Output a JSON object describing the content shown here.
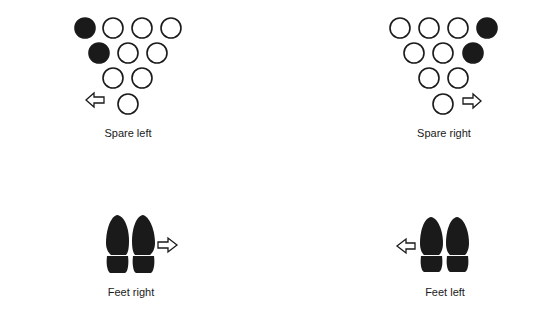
{
  "colors": {
    "ink": "#1a1a1a",
    "background": "#ffffff"
  },
  "panels": [
    {
      "id": "spare-left",
      "label": "Spare left",
      "type": "pins",
      "arrow": "left-arrow-icon",
      "pins": [
        {
          "row": 1,
          "pos": 1,
          "filled": true
        },
        {
          "row": 1,
          "pos": 2,
          "filled": false
        },
        {
          "row": 1,
          "pos": 3,
          "filled": false
        },
        {
          "row": 1,
          "pos": 4,
          "filled": false
        },
        {
          "row": 2,
          "pos": 1,
          "filled": true
        },
        {
          "row": 2,
          "pos": 2,
          "filled": false
        },
        {
          "row": 2,
          "pos": 3,
          "filled": false
        },
        {
          "row": 3,
          "pos": 1,
          "filled": false
        },
        {
          "row": 3,
          "pos": 2,
          "filled": false
        },
        {
          "row": 4,
          "pos": 1,
          "filled": false
        }
      ]
    },
    {
      "id": "spare-right",
      "label": "Spare right",
      "type": "pins",
      "arrow": "right-arrow-icon",
      "pins": [
        {
          "row": 1,
          "pos": 1,
          "filled": false
        },
        {
          "row": 1,
          "pos": 2,
          "filled": false
        },
        {
          "row": 1,
          "pos": 3,
          "filled": false
        },
        {
          "row": 1,
          "pos": 4,
          "filled": true
        },
        {
          "row": 2,
          "pos": 1,
          "filled": false
        },
        {
          "row": 2,
          "pos": 2,
          "filled": false
        },
        {
          "row": 2,
          "pos": 3,
          "filled": true
        },
        {
          "row": 3,
          "pos": 1,
          "filled": false
        },
        {
          "row": 3,
          "pos": 2,
          "filled": false
        },
        {
          "row": 4,
          "pos": 1,
          "filled": false
        }
      ]
    },
    {
      "id": "feet-right",
      "label": "Feet right",
      "type": "feet",
      "arrow": "right-arrow-icon"
    },
    {
      "id": "feet-left",
      "label": "Feet left",
      "type": "feet",
      "arrow": "left-arrow-icon"
    }
  ]
}
